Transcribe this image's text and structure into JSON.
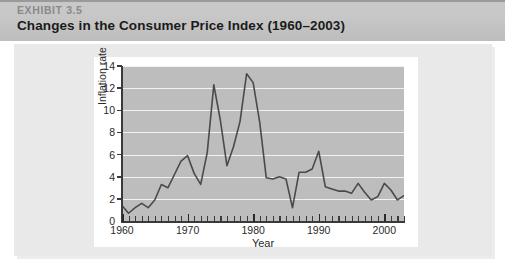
{
  "exhibit": {
    "kicker": "EXHIBIT 3.5",
    "title": "Changes in the Consumer Price Index (1960–2003)"
  },
  "colors": {
    "header_band": "#c7c7c7",
    "outer_panel": "#e9e9e9",
    "chart_card": "#ffffff",
    "plot_background": "#bdbdbd",
    "gridline": "#f1f1f1",
    "line": "#4a4a4a",
    "axis": "#3a3a3a",
    "kicker_text": "#8a8a8a",
    "title_text": "#1b1b1b"
  },
  "chart_data": {
    "type": "line",
    "title": "Changes in the Consumer Price Index (1960–2003)",
    "xlabel": "Year",
    "ylabel": "Inflation rate",
    "xlim": [
      1960,
      2003
    ],
    "ylim": [
      0,
      14
    ],
    "yticks": [
      0,
      2,
      4,
      6,
      8,
      10,
      12,
      14
    ],
    "xticks": [
      1960,
      1970,
      1980,
      1990,
      2000
    ],
    "xtick_labels": [
      "1960",
      "1970",
      "1980",
      "1990",
      "2000"
    ],
    "ytick_labels": [
      "0",
      "2",
      "4",
      "6",
      "8",
      "10",
      "12",
      "14"
    ],
    "grid": true,
    "grid_axis": "y",
    "legend": null,
    "series": [
      {
        "name": "Inflation rate",
        "x": [
          1960,
          1961,
          1962,
          1963,
          1964,
          1965,
          1966,
          1967,
          1968,
          1969,
          1970,
          1971,
          1972,
          1973,
          1974,
          1975,
          1976,
          1977,
          1978,
          1979,
          1980,
          1981,
          1982,
          1983,
          1984,
          1985,
          1986,
          1987,
          1988,
          1989,
          1990,
          1991,
          1992,
          1993,
          1994,
          1995,
          1996,
          1997,
          1998,
          1999,
          2000,
          2001,
          2002,
          2003
        ],
        "values": [
          1.4,
          0.7,
          1.2,
          1.6,
          1.2,
          1.9,
          3.3,
          3.0,
          4.2,
          5.4,
          5.9,
          4.3,
          3.3,
          6.2,
          12.3,
          9.1,
          5.0,
          6.7,
          9.0,
          13.3,
          12.5,
          8.9,
          3.9,
          3.8,
          4.0,
          3.8,
          1.2,
          4.4,
          4.4,
          4.7,
          6.3,
          3.1,
          2.9,
          2.7,
          2.7,
          2.5,
          3.4,
          2.6,
          1.9,
          2.2,
          3.4,
          2.8,
          1.9,
          2.3
        ]
      }
    ]
  },
  "axis_title_x": "Year",
  "axis_title_y": "Inflation rate"
}
